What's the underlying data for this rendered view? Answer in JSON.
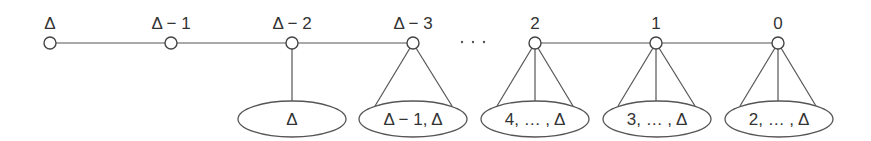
{
  "diagram": {
    "colors": {
      "line": "#555555",
      "text": "#333333",
      "background": "#ffffff"
    },
    "nodes": [
      {
        "label": "Δ",
        "x": 50
      },
      {
        "label": "Δ − 1",
        "x": 171
      },
      {
        "label": "Δ − 2",
        "x": 292
      },
      {
        "label": "Δ − 3",
        "x": 413
      },
      {
        "label": "2",
        "x": 535
      },
      {
        "label": "1",
        "x": 656
      },
      {
        "label": "0",
        "x": 778
      }
    ],
    "ellipsis": "· · ·",
    "groups": [
      {
        "parent": "Δ − 2",
        "label": "Δ"
      },
      {
        "parent": "Δ − 3",
        "label": "Δ − 1, Δ"
      },
      {
        "parent": "2",
        "label": "4, … , Δ"
      },
      {
        "parent": "1",
        "label": "3, … , Δ"
      },
      {
        "parent": "0",
        "label": "2, … , Δ"
      }
    ]
  }
}
